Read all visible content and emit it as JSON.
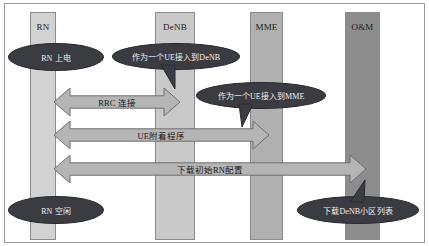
{
  "diagram": {
    "type": "sequence-diagram",
    "background_color": "#ffffff",
    "border_color": "#9a9a9a",
    "lifelines": [
      {
        "id": "rn",
        "label": "RN",
        "color": "#d2d2d2",
        "x": 30,
        "y": 12,
        "width": 26,
        "height": 228
      },
      {
        "id": "denb",
        "label": "DeNB",
        "color": "#c9c9c9",
        "x": 155,
        "y": 12,
        "width": 40,
        "height": 228
      },
      {
        "id": "mme",
        "label": "MME",
        "color": "#b0b0b0",
        "x": 250,
        "y": 12,
        "width": 33,
        "height": 228
      },
      {
        "id": "oam",
        "label": "O&M",
        "color": "#8d8d8d",
        "x": 345,
        "y": 12,
        "width": 35,
        "height": 228
      }
    ],
    "messages": [
      {
        "id": "rrc-connection",
        "label": "RRC 连接",
        "from": "RN",
        "to": "DeNB",
        "direction": "bidirectional",
        "fill": "#b5b5b5",
        "stroke": "#6f6f6f",
        "x": 54,
        "y": 88,
        "width": 126,
        "height": 28
      },
      {
        "id": "ue-attach-procedure",
        "label": "UE附着程序",
        "from": "RN",
        "to": "MME",
        "direction": "bidirectional",
        "fill": "#b5b5b5",
        "stroke": "#6f6f6f",
        "x": 54,
        "y": 121,
        "width": 215,
        "height": 28
      },
      {
        "id": "download-initial-rn-config",
        "label": "下载初始RN配置",
        "from": "RN",
        "to": "O&M",
        "direction": "bidirectional",
        "fill": "#b5b5b5",
        "stroke": "#6f6f6f",
        "x": 54,
        "y": 155,
        "width": 312,
        "height": 28
      }
    ],
    "callouts": [
      {
        "id": "rn-power-on",
        "label": "RN 上电",
        "x": 8,
        "y": 43,
        "width": 96,
        "height": 28,
        "tail": false
      },
      {
        "id": "access-denb-as-ue",
        "label": "作为一个UE接入到DeNB",
        "x": 112,
        "y": 43,
        "width": 128,
        "height": 27,
        "tail": true,
        "tail_x": 56,
        "tail_y": 22,
        "tail_tip_x": 63,
        "tail_tip_y": 46
      },
      {
        "id": "access-mme-as-ue",
        "label": "作为一个UE接入到MME",
        "x": 196,
        "y": 82,
        "width": 130,
        "height": 27,
        "tail": true,
        "tail_x": 50,
        "tail_y": 22,
        "tail_tip_x": 46,
        "tail_tip_y": 45
      },
      {
        "id": "rn-idle",
        "label": "RN 空闲",
        "x": 8,
        "y": 196,
        "width": 96,
        "height": 28,
        "tail": false
      },
      {
        "id": "download-denb-cell-list",
        "label": "下载DeNB小区列表",
        "x": 297,
        "y": 196,
        "width": 122,
        "height": 28,
        "tail": true,
        "tail_x": 60,
        "tail_y": 6,
        "tail_tip_x": 68,
        "tail_tip_y": -16
      }
    ]
  }
}
